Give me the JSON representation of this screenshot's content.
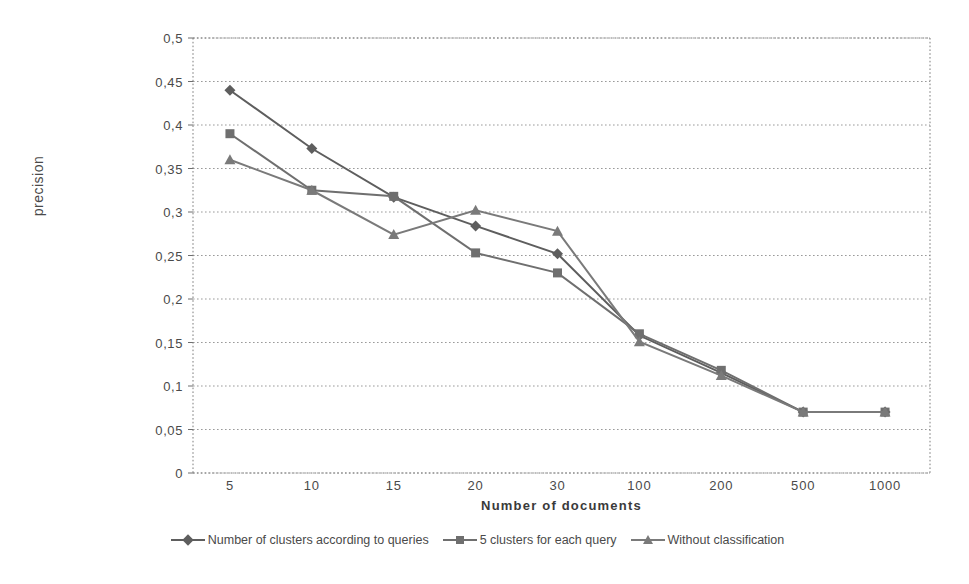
{
  "chart_data": {
    "type": "line",
    "title": "",
    "xlabel": "Number of documents",
    "ylabel": "precision",
    "categories": [
      "5",
      "10",
      "15",
      "20",
      "30",
      "100",
      "200",
      "500",
      "1000"
    ],
    "ytick_labels": [
      "0",
      "0,05",
      "0,1",
      "0,15",
      "0,2",
      "0,25",
      "0,3",
      "0,35",
      "0,4",
      "0,45",
      "0,5"
    ],
    "ytick_values": [
      0,
      0.05,
      0.1,
      0.15,
      0.2,
      0.25,
      0.3,
      0.35,
      0.4,
      0.45,
      0.5
    ],
    "ylim": [
      0,
      0.5
    ],
    "grid": true,
    "legend_position": "bottom",
    "series": [
      {
        "name": "Number of clusters according to queries",
        "marker": "diamond",
        "color": "#5e5e5e",
        "values": [
          0.44,
          0.373,
          0.317,
          0.284,
          0.252,
          0.158,
          0.115,
          0.07,
          0.07
        ]
      },
      {
        "name": "5 clusters for each query",
        "marker": "square",
        "color": "#6f6f6f",
        "values": [
          0.39,
          0.325,
          0.318,
          0.253,
          0.23,
          0.16,
          0.118,
          0.07,
          0.07
        ]
      },
      {
        "name": "Without classification",
        "marker": "triangle",
        "color": "#7a7a7a",
        "values": [
          0.36,
          0.325,
          0.274,
          0.302,
          0.278,
          0.151,
          0.112,
          0.07,
          0.07
        ]
      }
    ]
  },
  "legend": {
    "entries": [
      {
        "label": "Number of clusters according to queries"
      },
      {
        "label": "5 clusters for each query"
      },
      {
        "label": "Without classification"
      }
    ]
  }
}
